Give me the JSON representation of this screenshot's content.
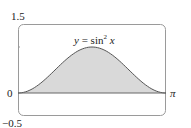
{
  "chart_data": {
    "type": "area",
    "title": "",
    "annotation": "y = sin² x",
    "function": "sin^2(x)",
    "x": [
      0,
      0.3927,
      0.7854,
      1.1781,
      1.5708,
      1.9635,
      2.3562,
      2.7489,
      3.1416
    ],
    "y": [
      0,
      0.1464,
      0.5,
      0.8536,
      1.0,
      0.8536,
      0.5,
      0.1464,
      0
    ],
    "xlim": [
      0,
      3.1416
    ],
    "ylim": [
      -0.5,
      1.5
    ],
    "x_tick_labels": [
      "π"
    ],
    "y_tick_labels": [
      "1.5",
      "0",
      "-0.5"
    ],
    "xlabel": "",
    "ylabel": "",
    "grid": false,
    "legend": null
  },
  "labels": {
    "ymax": "1.5",
    "zero": "0",
    "ymin": "−0.5",
    "xmax": "π",
    "eq_y": "y",
    "eq_mid": " = sin",
    "eq_sup": "2",
    "eq_x": " x"
  },
  "colors": {
    "fill": "#d9d9d9",
    "curve": "#555555",
    "frame": "#9a9a9a"
  }
}
